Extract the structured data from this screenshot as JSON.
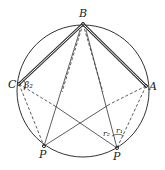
{
  "diagram": {
    "type": "geometry",
    "circle": {
      "cx": 83,
      "cy": 91,
      "r": 66
    },
    "points": {
      "B": {
        "label": "B",
        "x": 83,
        "y": 24
      },
      "C": {
        "label": "C",
        "x": 19,
        "y": 84
      },
      "A": {
        "label": "A",
        "x": 146,
        "y": 86
      },
      "P1": {
        "label": "P",
        "x": 44,
        "y": 146
      },
      "P2": {
        "label": "P",
        "x": 117,
        "y": 148
      }
    },
    "angle_labels": {
      "beta2": "β₂",
      "r2": "r₂",
      "r1": "r₁"
    },
    "colors": {
      "stroke": "#333333",
      "background": "#ffffff"
    }
  }
}
